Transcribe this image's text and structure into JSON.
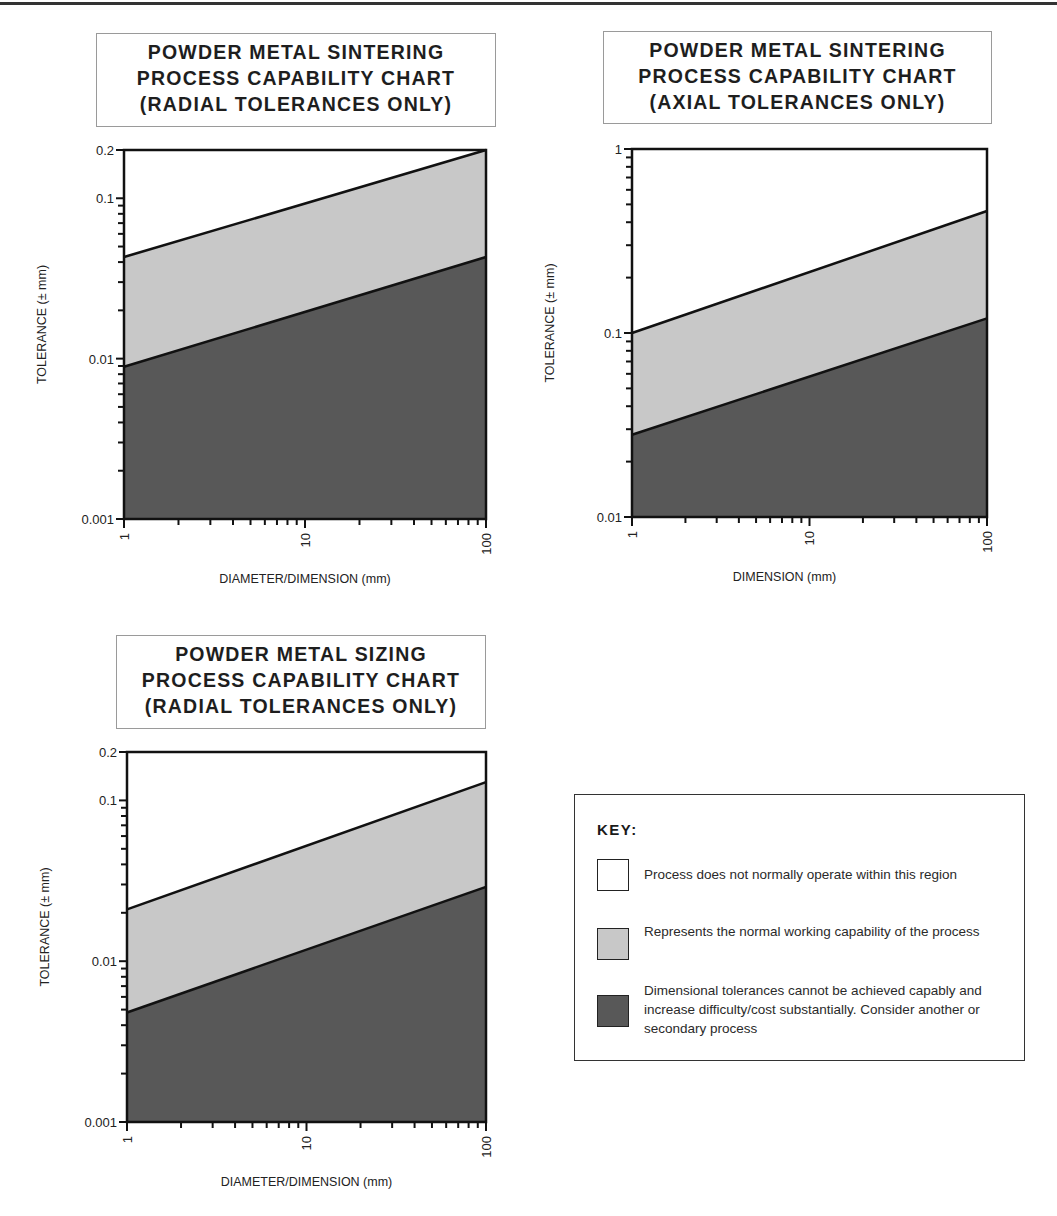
{
  "chart_data": [
    {
      "type": "area",
      "title": "POWDER METAL SINTERING PROCESS CAPABILITY CHART (RADIAL TOLERANCES ONLY)",
      "title_lines": [
        "POWDER METAL SINTERING",
        "PROCESS CAPABILITY CHART",
        "(RADIAL TOLERANCES ONLY)"
      ],
      "xlabel": "DIAMETER/DIMENSION (mm)",
      "ylabel": "TOLERANCE (± mm)",
      "xscale": "log",
      "yscale": "log",
      "xlim": [
        1,
        100
      ],
      "ylim": [
        0.001,
        0.2
      ],
      "x_ticks": [
        "1",
        "10",
        "100"
      ],
      "y_ticks": [
        "0.001",
        "0.01",
        "0.1",
        "0.2"
      ],
      "x": [
        1,
        100
      ],
      "series": [
        {
          "name": "Upper boundary (normal capability max)",
          "values": [
            0.043,
            0.2
          ]
        },
        {
          "name": "Lower boundary (normal capability min)",
          "values": [
            0.0089,
            0.043
          ]
        }
      ]
    },
    {
      "type": "area",
      "title": "POWDER METAL SINTERING PROCESS CAPABILITY CHART (AXIAL TOLERANCES ONLY)",
      "title_lines": [
        "POWDER METAL SINTERING",
        "PROCESS CAPABILITY CHART",
        "(AXIAL TOLERANCES ONLY)"
      ],
      "xlabel": "DIMENSION (mm)",
      "ylabel": "TOLERANCE (± mm)",
      "xscale": "log",
      "yscale": "log",
      "xlim": [
        1,
        100
      ],
      "ylim": [
        0.01,
        1
      ],
      "x_ticks": [
        "1",
        "10",
        "100"
      ],
      "y_ticks": [
        "0.01",
        "0.1",
        "1"
      ],
      "x": [
        1,
        100
      ],
      "series": [
        {
          "name": "Upper boundary (normal capability max)",
          "values": [
            0.1,
            0.46
          ]
        },
        {
          "name": "Lower boundary (normal capability min)",
          "values": [
            0.028,
            0.12
          ]
        }
      ]
    },
    {
      "type": "area",
      "title": "POWDER METAL SIZING PROCESS CAPABILITY CHART (RADIAL TOLERANCES ONLY)",
      "title_lines": [
        "POWDER METAL SIZING",
        "PROCESS CAPABILITY CHART",
        "(RADIAL TOLERANCES ONLY)"
      ],
      "xlabel": "DIAMETER/DIMENSION (mm)",
      "ylabel": "TOLERANCE (± mm)",
      "xscale": "log",
      "yscale": "log",
      "xlim": [
        1,
        100
      ],
      "ylim": [
        0.001,
        0.2
      ],
      "x_ticks": [
        "1",
        "10",
        "100"
      ],
      "y_ticks": [
        "0.001",
        "0.01",
        "0.1",
        "0.2"
      ],
      "x": [
        1,
        100
      ],
      "series": [
        {
          "name": "Upper boundary (normal capability max)",
          "values": [
            0.021,
            0.13
          ]
        },
        {
          "name": "Lower boundary (normal capability min)",
          "values": [
            0.0048,
            0.029
          ]
        }
      ]
    }
  ],
  "key": {
    "title": "KEY:",
    "items": [
      {
        "label": "Process does not normally operate within this region",
        "color": "#ffffff"
      },
      {
        "label": "Represents the normal working capability of the process",
        "color": "#c8c8c8"
      },
      {
        "label": "Dimensional tolerances cannot be achieved capably and increase difficulty/cost substantially. Consider another or secondary process",
        "color": "#585858"
      }
    ]
  },
  "colors": {
    "white_region": "#ffffff",
    "light_region": "#c8c8c8",
    "dark_region": "#585858",
    "line": "#111111"
  }
}
